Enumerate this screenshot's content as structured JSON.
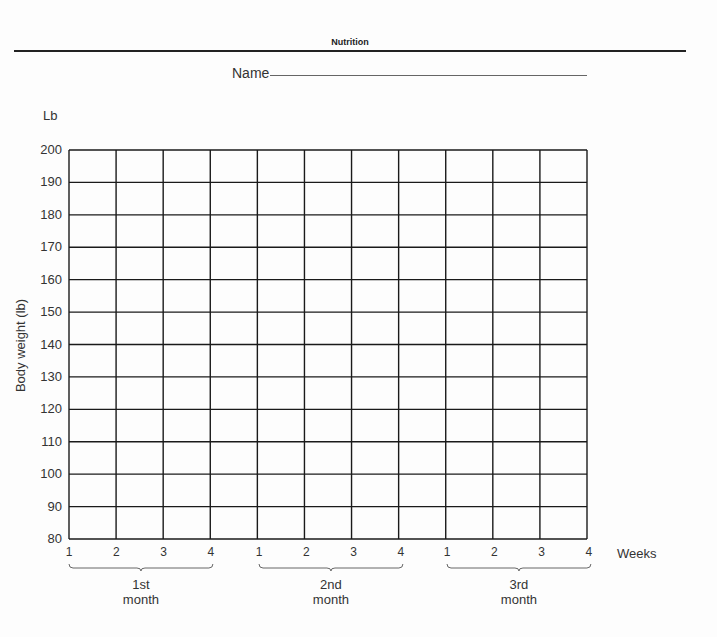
{
  "header": {
    "title": "Nutrition"
  },
  "form": {
    "name_label": "Name"
  },
  "chart_data": {
    "type": "line",
    "ylabel": "Body weight (lb)",
    "unit_label": "Lb",
    "xlabel": "Weeks",
    "ylim": [
      80,
      200
    ],
    "yticks": [
      80,
      90,
      100,
      110,
      120,
      130,
      140,
      150,
      160,
      170,
      180,
      190,
      200
    ],
    "grid": true,
    "x_groups": [
      {
        "label_line1": "1st",
        "label_line2": "month",
        "weeks": [
          "1",
          "2",
          "3",
          "4"
        ]
      },
      {
        "label_line1": "2nd",
        "label_line2": "month",
        "weeks": [
          "1",
          "2",
          "3",
          "4"
        ]
      },
      {
        "label_line1": "3rd",
        "label_line2": "month",
        "weeks": [
          "1",
          "2",
          "3",
          "4"
        ]
      }
    ],
    "series": []
  },
  "colors": {
    "grid": "#1a1a1a",
    "text": "#333333"
  }
}
